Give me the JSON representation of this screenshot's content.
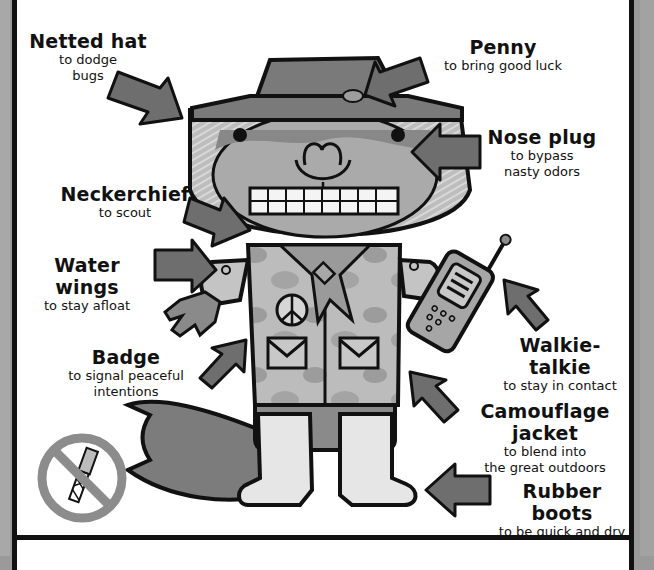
{
  "illustration": {
    "subject": "scout character in outfit",
    "colors": {
      "ink": "#111111",
      "arrow": "#6e6e6e",
      "skin": "#8a8a8a",
      "hat": "#7a7a7a",
      "jacket": "#b4b4b4",
      "boots": "#e6e6e6",
      "no_sign": "#8c8c8c"
    }
  },
  "callouts": [
    {
      "id": "netted-hat",
      "title": "Netted hat",
      "description": [
        "to dodge",
        "bugs"
      ]
    },
    {
      "id": "penny",
      "title": "Penny",
      "description": [
        "to bring good luck"
      ]
    },
    {
      "id": "nose-plug",
      "title": "Nose plug",
      "description": [
        "to bypass",
        "nasty odors"
      ]
    },
    {
      "id": "neckerchief",
      "title": "Neckerchief",
      "description": [
        "to scout"
      ]
    },
    {
      "id": "water-wings",
      "title": "Water wings",
      "description": [
        "to stay afloat"
      ]
    },
    {
      "id": "badge",
      "title": "Badge",
      "description": [
        "to signal peaceful",
        "intentions"
      ]
    },
    {
      "id": "walkie-talkie",
      "title": "Walkie-talkie",
      "description": [
        "to stay in contact"
      ]
    },
    {
      "id": "camouflage-jacket",
      "title": "Camouflage jacket",
      "description": [
        "to blend into",
        "the great outdoors"
      ]
    },
    {
      "id": "rubber-boots",
      "title": "Rubber boots",
      "description": [
        "to be quick and dry"
      ]
    }
  ],
  "prohibited_item": {
    "icon": "no-pocketknife-icon"
  }
}
